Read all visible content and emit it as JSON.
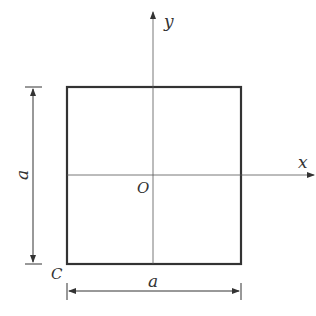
{
  "diagram": {
    "labels": {
      "y_axis": "y",
      "x_axis": "x",
      "origin": "O",
      "corner": "C",
      "side_left": "a",
      "side_bottom": "a"
    },
    "colors": {
      "stroke": "#333333",
      "background": "#ffffff"
    }
  }
}
